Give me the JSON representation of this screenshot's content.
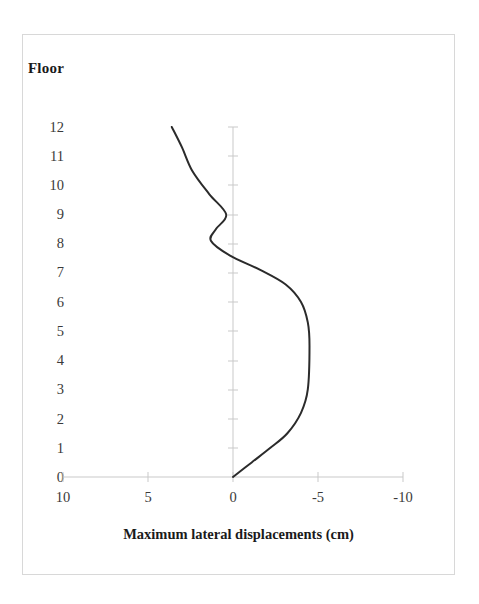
{
  "figure": {
    "background_color": "#ffffff",
    "frame_color": "#d8d8d8",
    "axis_color": "#c9c9c9",
    "curve_color": "#2b2b2b",
    "text_color": "#3a3a3a"
  },
  "labels": {
    "y_axis_title": "Floor",
    "x_axis_title": "Maximum lateral displacements (cm)"
  },
  "ticks": {
    "y": [
      "12",
      "11",
      "10",
      "9",
      "8",
      "7",
      "6",
      "5",
      "4",
      "3",
      "2",
      "1",
      "0"
    ],
    "x": [
      "10",
      "5",
      "0",
      "-5",
      "-10"
    ]
  },
  "chart_data": {
    "type": "line",
    "title": "",
    "subtitle": "",
    "xlabel": "Maximum lateral displacements (cm)",
    "ylabel": "Floor",
    "xlim": [
      10,
      -10
    ],
    "ylim": [
      0,
      12
    ],
    "x_axis_reversed": true,
    "grid": false,
    "legend": null,
    "legend_position": "none",
    "x_ticks": [
      10,
      5,
      0,
      -5,
      -10
    ],
    "y_ticks": [
      0,
      1,
      2,
      3,
      4,
      5,
      6,
      7,
      8,
      9,
      10,
      11,
      12
    ],
    "annotations": [],
    "series": [
      {
        "name": "Maximum lateral displacement",
        "color": "#2b2b2b",
        "x": [
          0.0,
          -1.1,
          -2.2,
          -3.2,
          -4.0,
          -4.4,
          -4.5,
          -4.4,
          -4.0,
          -3.1,
          -1.6,
          0.2,
          1.3,
          1.0,
          0.4,
          1.4,
          2.4,
          3.0,
          3.6
        ],
        "y": [
          0.0,
          0.5,
          1.0,
          1.5,
          2.2,
          3.0,
          4.5,
          5.3,
          6.0,
          6.6,
          7.1,
          7.6,
          8.1,
          8.5,
          9.0,
          9.7,
          10.5,
          11.3,
          12.0
        ]
      }
    ],
    "notable_points": {
      "base_floor_0": 0.0,
      "max_negative_displacement": -4.5,
      "max_negative_floor": 4.5,
      "sign_reversal_floor": 7.6,
      "local_positive_peak": 1.3,
      "local_positive_peak_floor": 8.1,
      "local_dip": 0.4,
      "local_dip_floor": 9.0,
      "top_floor_12": 3.6
    }
  },
  "geometry": {
    "x_pixel_for_value_10": 63,
    "x_pixel_for_value_0": 233,
    "x_pixel_for_value_minus10": 403,
    "y_pixel_for_floor_0": 477,
    "y_pixel_for_floor_12": 127,
    "pixels_per_cm": 17.0,
    "pixels_per_floor": 29.17
  }
}
